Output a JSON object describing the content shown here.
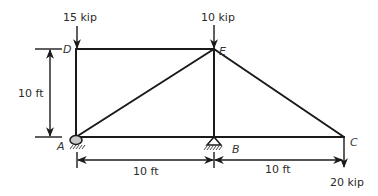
{
  "diagram": {
    "type": "truss",
    "nodes": [
      {
        "id": "A",
        "label": "A"
      },
      {
        "id": "B",
        "label": "B"
      },
      {
        "id": "C",
        "label": "C"
      },
      {
        "id": "D",
        "label": "D"
      },
      {
        "id": "E",
        "label": "E"
      }
    ],
    "members": [
      {
        "from": "A",
        "to": "D"
      },
      {
        "from": "D",
        "to": "E"
      },
      {
        "from": "A",
        "to": "E"
      },
      {
        "from": "E",
        "to": "B"
      },
      {
        "from": "E",
        "to": "C"
      },
      {
        "from": "A",
        "to": "B"
      },
      {
        "from": "B",
        "to": "C"
      }
    ],
    "supports": [
      {
        "node": "A",
        "type": "pin"
      },
      {
        "node": "B",
        "type": "roller"
      }
    ],
    "loads": [
      {
        "node": "D",
        "label": "15 kip",
        "direction": "down"
      },
      {
        "node": "E",
        "label": "10 kip",
        "direction": "down"
      },
      {
        "node": "C",
        "label": "20 kip",
        "direction": "down"
      }
    ],
    "dimensions": {
      "height": "10 ft",
      "span_AB": "10 ft",
      "span_BC": "10 ft"
    }
  }
}
